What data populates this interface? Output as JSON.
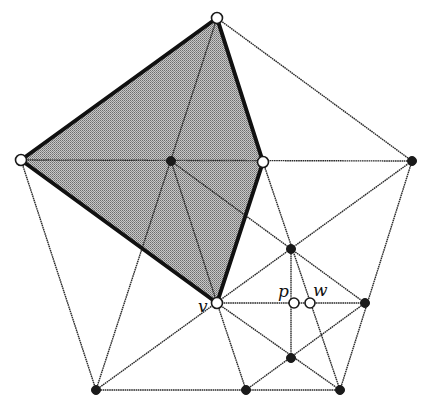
{
  "diagram": {
    "colors": {
      "shade": "#a3a3a3",
      "edge": "#2a2a2a",
      "thick_edge": "#111111",
      "node_black": "#1a1a1a",
      "node_white": "#ffffff"
    },
    "nodes": [
      {
        "id": "T",
        "x": 217,
        "y": 18,
        "fill": "white"
      },
      {
        "id": "Lv",
        "x": 21,
        "y": 160,
        "fill": "white"
      },
      {
        "id": "C",
        "x": 171,
        "y": 161,
        "fill": "black"
      },
      {
        "id": "W",
        "x": 263,
        "y": 162,
        "fill": "white"
      },
      {
        "id": "RV",
        "x": 412,
        "y": 161,
        "fill": "black"
      },
      {
        "id": "N",
        "x": 291,
        "y": 249,
        "fill": "black"
      },
      {
        "id": "v",
        "x": 217,
        "y": 303,
        "fill": "white",
        "label": "v"
      },
      {
        "id": "p",
        "x": 294,
        "y": 303,
        "fill": "white",
        "label": "p"
      },
      {
        "id": "w",
        "x": 310,
        "y": 303,
        "fill": "white",
        "label": "w"
      },
      {
        "id": "R",
        "x": 365,
        "y": 303,
        "fill": "black"
      },
      {
        "id": "L",
        "x": 291,
        "y": 358,
        "fill": "black"
      },
      {
        "id": "BL",
        "x": 96,
        "y": 390,
        "fill": "black"
      },
      {
        "id": "BM",
        "x": 246,
        "y": 390,
        "fill": "black"
      },
      {
        "id": "BR",
        "x": 340,
        "y": 390,
        "fill": "black"
      }
    ],
    "labels": [
      {
        "text": "v",
        "x": 198,
        "y": 312
      },
      {
        "text": "p",
        "x": 278,
        "y": 297
      },
      {
        "text": "w",
        "x": 313,
        "y": 296
      }
    ],
    "shaded_polygon": "T Lv v W",
    "thick_edges": [
      "T-Lv",
      "Lv-v",
      "v-W",
      "W-T"
    ]
  }
}
